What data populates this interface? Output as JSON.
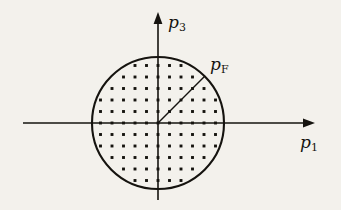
{
  "figure": {
    "background_color": "#f3f1ec",
    "ink_color": "#15130f",
    "labels": {
      "vertical_axis": "p",
      "vertical_axis_subscript": "3",
      "horizontal_axis": "p",
      "horizontal_axis_subscript": "1",
      "radius": "p",
      "radius_subscript": "F"
    },
    "geometry": {
      "origin_x": 158,
      "origin_y": 123,
      "circle_radius": 66,
      "lattice_spacing": 11.5,
      "radius_line_angle_deg": 45,
      "horizontal_axis_start_x": 23,
      "horizontal_axis_end_x": 315,
      "vertical_axis_start_y": 200,
      "vertical_axis_end_y": 12
    }
  },
  "chart_data": {
    "type": "scatter",
    "xlabel": "p_1",
    "ylabel": "p_3",
    "annotations": [
      {
        "text": "p_F",
        "kind": "radius-line",
        "from": [
          0,
          0
        ],
        "to": [
          46.7,
          46.7
        ],
        "description": "Fermi momentum radius drawn from origin to circle boundary at 45 degrees"
      }
    ],
    "shapes": [
      {
        "kind": "circle",
        "center": [
          0,
          0
        ],
        "radius": 66,
        "filled": false,
        "description": "Fermi surface boundary"
      }
    ],
    "grid": false,
    "legend": "none",
    "xlim": [
      -135,
      157
    ],
    "ylim": [
      -77,
      111
    ],
    "lattice": {
      "description": "Uniform square lattice of occupied momentum states inside the Fermi sphere",
      "spacing": 11.5,
      "marker": "filled-square-dot"
    }
  }
}
